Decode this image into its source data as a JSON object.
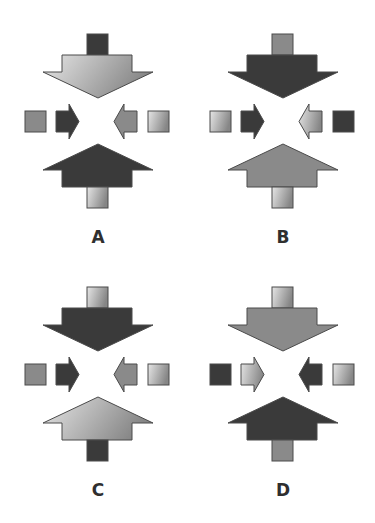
{
  "figure": {
    "colors": {
      "dark": "#3a3a3a",
      "medium": "#8a8a8a",
      "light_gradient_start": "#e2e2e2",
      "light_gradient_end": "#8a8a8a",
      "stroke": "#4a4a4a"
    },
    "panels": [
      {
        "label": "A",
        "top_square": "dark",
        "top_arrow": "light",
        "left_square": "medium",
        "left_arrow": "dark",
        "right_arrow": "medium",
        "right_square": "light",
        "bottom_arrow": "dark",
        "bottom_square": "light"
      },
      {
        "label": "B",
        "top_square": "medium",
        "top_arrow": "dark",
        "left_square": "light",
        "left_arrow": "dark",
        "right_arrow": "light",
        "right_square": "dark",
        "bottom_arrow": "medium",
        "bottom_square": "light"
      },
      {
        "label": "C",
        "top_square": "light",
        "top_arrow": "dark",
        "left_square": "medium",
        "left_arrow": "dark",
        "right_arrow": "medium",
        "right_square": "light",
        "bottom_arrow": "light",
        "bottom_square": "dark"
      },
      {
        "label": "D",
        "top_square": "light",
        "top_arrow": "medium",
        "left_square": "dark",
        "left_arrow": "light",
        "right_arrow": "dark",
        "right_square": "light",
        "bottom_arrow": "dark",
        "bottom_square": "medium"
      }
    ]
  }
}
